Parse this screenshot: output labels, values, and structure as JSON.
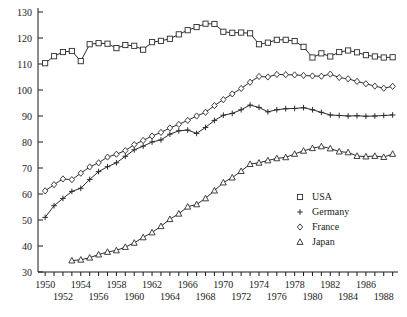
{
  "chart_data": {
    "type": "line",
    "title": "",
    "subtitle": "",
    "xlabel": "",
    "ylabel": "",
    "xlim": [
      1949.2,
      1989.6
    ],
    "ylim": [
      30,
      130
    ],
    "grid": false,
    "legend_position": "inside-bottom-right",
    "y_ticks": [
      30,
      40,
      50,
      60,
      70,
      80,
      90,
      100,
      110,
      120,
      130
    ],
    "x_ticks": [
      1950,
      1951,
      1952,
      1953,
      1954,
      1955,
      1956,
      1957,
      1958,
      1959,
      1960,
      1961,
      1962,
      1963,
      1964,
      1965,
      1966,
      1967,
      1968,
      1969,
      1970,
      1971,
      1972,
      1973,
      1974,
      1975,
      1976,
      1977,
      1978,
      1979,
      1980,
      1981,
      1982,
      1983,
      1984,
      1985,
      1986,
      1987,
      1988,
      1989
    ],
    "x_tick_labels_row1": [
      1950,
      1954,
      1958,
      1962,
      1966,
      1970,
      1974,
      1978,
      1982,
      1986
    ],
    "x_tick_labels_row2": [
      1952,
      1956,
      1960,
      1964,
      1968,
      1972,
      1976,
      1980,
      1984,
      1988
    ],
    "series": [
      {
        "name": "USA",
        "marker": "square",
        "x": [
          1950,
          1951,
          1952,
          1953,
          1954,
          1955,
          1956,
          1957,
          1958,
          1959,
          1960,
          1961,
          1962,
          1963,
          1964,
          1965,
          1966,
          1967,
          1968,
          1969,
          1970,
          1971,
          1972,
          1973,
          1974,
          1975,
          1976,
          1977,
          1978,
          1979,
          1980,
          1981,
          1982,
          1983,
          1984,
          1985,
          1986,
          1987,
          1988,
          1989
        ],
        "values": [
          110.3,
          113.0,
          114.6,
          115.0,
          111.1,
          117.6,
          118.0,
          117.8,
          116.1,
          117.3,
          117.0,
          115.5,
          118.4,
          118.9,
          119.7,
          121.4,
          123.0,
          124.2,
          125.5,
          125.4,
          122.4,
          122.0,
          122.1,
          121.8,
          117.6,
          118.2,
          119.3,
          119.3,
          118.8,
          116.6,
          112.5,
          114.1,
          112.9,
          114.6,
          115.2,
          114.5,
          113.4,
          112.9,
          112.5,
          112.6
        ]
      },
      {
        "name": "Germany",
        "marker": "plus",
        "x": [
          1950,
          1951,
          1952,
          1953,
          1954,
          1955,
          1956,
          1957,
          1958,
          1959,
          1960,
          1961,
          1962,
          1963,
          1964,
          1965,
          1966,
          1967,
          1968,
          1969,
          1970,
          1971,
          1972,
          1973,
          1974,
          1975,
          1976,
          1977,
          1978,
          1979,
          1980,
          1981,
          1982,
          1983,
          1984,
          1985,
          1986,
          1987,
          1988,
          1989
        ],
        "values": [
          51.0,
          55.5,
          58.3,
          61.0,
          62.2,
          65.6,
          68.6,
          70.5,
          72.0,
          74.5,
          77.0,
          78.4,
          80.0,
          80.8,
          83.0,
          84.3,
          84.6,
          83.3,
          85.6,
          88.3,
          90.3,
          91.0,
          92.4,
          94.2,
          93.3,
          91.6,
          92.4,
          92.8,
          92.9,
          93.2,
          92.4,
          91.4,
          90.4,
          90.2,
          90.0,
          90.1,
          89.9,
          90.0,
          90.2,
          90.4
        ]
      },
      {
        "name": "France",
        "marker": "diamond",
        "x": [
          1950,
          1951,
          1952,
          1953,
          1954,
          1955,
          1956,
          1957,
          1958,
          1959,
          1960,
          1961,
          1962,
          1963,
          1964,
          1965,
          1966,
          1967,
          1968,
          1969,
          1970,
          1971,
          1972,
          1973,
          1974,
          1975,
          1976,
          1977,
          1978,
          1979,
          1980,
          1981,
          1982,
          1983,
          1984,
          1985,
          1986,
          1987,
          1988,
          1989
        ],
        "values": [
          61.2,
          63.6,
          65.8,
          65.5,
          68.0,
          70.4,
          72.0,
          74.2,
          75.3,
          76.7,
          79.0,
          80.6,
          82.3,
          83.7,
          85.4,
          86.8,
          88.3,
          90.0,
          91.4,
          94.0,
          96.3,
          98.5,
          100.6,
          103.0,
          105.2,
          105.0,
          106.0,
          105.9,
          105.8,
          105.6,
          105.4,
          105.3,
          106.1,
          104.8,
          104.3,
          103.3,
          102.4,
          101.5,
          100.7,
          101.4
        ]
      },
      {
        "name": "Japan",
        "marker": "triangle",
        "x": [
          1953,
          1954,
          1955,
          1956,
          1957,
          1958,
          1959,
          1960,
          1961,
          1962,
          1963,
          1964,
          1965,
          1966,
          1967,
          1968,
          1969,
          1970,
          1971,
          1972,
          1973,
          1974,
          1975,
          1976,
          1977,
          1978,
          1979,
          1980,
          1981,
          1982,
          1983,
          1984,
          1985,
          1986,
          1987,
          1988,
          1989
        ],
        "values": [
          34.4,
          34.7,
          35.5,
          36.7,
          37.7,
          38.3,
          39.6,
          41.2,
          43.3,
          45.2,
          47.6,
          50.3,
          52.4,
          55.1,
          56.0,
          58.3,
          61.3,
          64.4,
          66.3,
          68.8,
          71.5,
          72.0,
          72.9,
          73.7,
          74.1,
          75.4,
          76.6,
          77.6,
          78.3,
          77.5,
          76.3,
          76.0,
          74.6,
          74.4,
          74.6,
          74.2,
          75.4
        ]
      }
    ]
  },
  "legend": {
    "items": [
      {
        "label": "USA",
        "marker": "square"
      },
      {
        "label": "Germany",
        "marker": "plus"
      },
      {
        "label": "France",
        "marker": "diamond"
      },
      {
        "label": "Japan",
        "marker": "triangle"
      }
    ]
  }
}
